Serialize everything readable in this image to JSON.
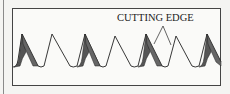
{
  "figure": {
    "label": "CUTTING EDGE",
    "colors": {
      "frame": "#444444",
      "outline": "#222222",
      "bevel_fill": "#555555",
      "background": "#fafaf8"
    },
    "teeth": [
      {
        "peak_x": 22,
        "shaded": true
      },
      {
        "peak_x": 52,
        "shaded": false
      },
      {
        "peak_x": 85,
        "shaded": true
      },
      {
        "peak_x": 115,
        "shaded": false
      },
      {
        "peak_x": 146,
        "shaded": true
      },
      {
        "peak_x": 176,
        "shaded": false
      },
      {
        "peak_x": 207,
        "shaded": true
      }
    ]
  }
}
